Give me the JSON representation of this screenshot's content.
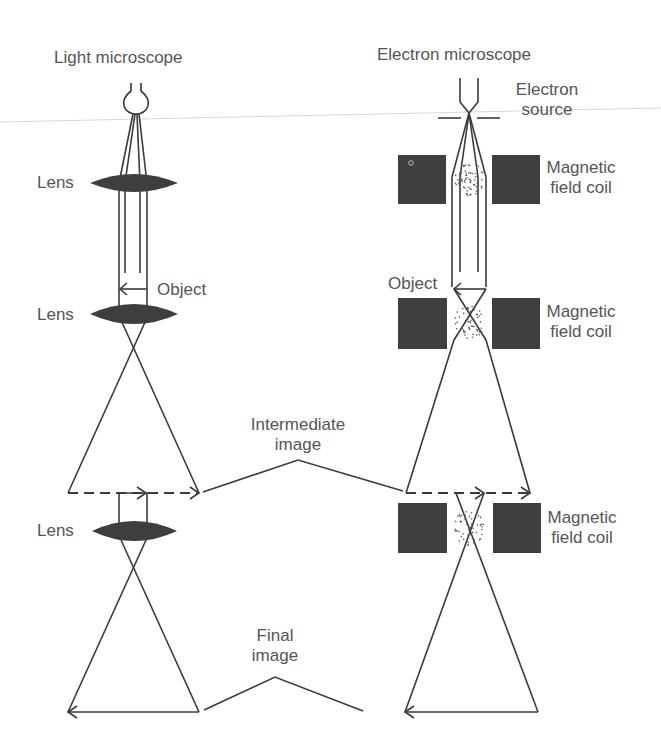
{
  "diagram": {
    "left_title": "Light microscope",
    "right_title": "Electron microscope",
    "light": {
      "source_icon": "light-bulb-icon",
      "lens_label_1": "Lens",
      "lens_label_2": "Lens",
      "lens_label_3": "Lens",
      "object_label": "Object"
    },
    "electron": {
      "source_label_line1": "Electron",
      "source_label_line2": "source",
      "coil_label_1_line1": "Magnetic",
      "coil_label_1_line2": "field coil",
      "coil_label_2_line1": "Magnetic",
      "coil_label_2_line2": "field coil",
      "coil_label_3_line1": "Magnetic",
      "coil_label_3_line2": "field coil",
      "object_label": "Object"
    },
    "shared": {
      "intermediate_line1": "Intermediate",
      "intermediate_line2": "image",
      "final_line1": "Final",
      "final_line2": "image"
    },
    "colors": {
      "ink": "#3a3a3a",
      "fill": "#3e3e3e",
      "text": "#555555",
      "background": "#ffffff"
    }
  }
}
